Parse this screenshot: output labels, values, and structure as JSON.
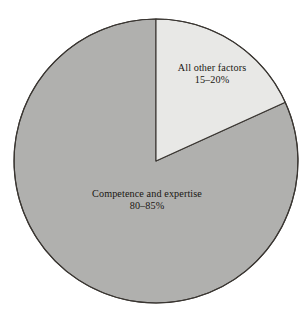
{
  "chart_data": {
    "type": "pie",
    "title": "",
    "subtitle": "",
    "xlabel": "",
    "ylabel": "",
    "grid": false,
    "legend_position": "none",
    "labels_placement": "inside-slices",
    "total_degrees": 360,
    "start_angle_deg": 0,
    "direction": "clockwise",
    "categories": [
      "All other factors",
      "Competence and expertise"
    ],
    "values": [
      18,
      82
    ],
    "value_labels": [
      "15–20%",
      "80–85%"
    ],
    "slices": [
      {
        "name": "All other factors",
        "label": "All other factors",
        "value_label": "15–20%",
        "range_low": 15,
        "range_high": 20,
        "value": 18,
        "sweep_deg": 65.6,
        "start_deg": 0,
        "end_deg": 65.6,
        "color": "#e8e8e6"
      },
      {
        "name": "Competence and expertise",
        "label": "Competence and expertise",
        "value_label": "80–85%",
        "range_low": 80,
        "range_high": 85,
        "value": 82,
        "sweep_deg": 294.4,
        "start_deg": 65.6,
        "end_deg": 360,
        "color": "#b0b0ae"
      }
    ]
  },
  "figure": {
    "background_color": "#ffffff",
    "outline_color": "#3a3632",
    "text_color": "#1a1713",
    "center_x": 156,
    "center_y": 161,
    "radius": 142
  },
  "labels": {
    "other_factors": {
      "title": "All other factors",
      "value": "15–20%"
    },
    "competence": {
      "title": "Competence and expertise",
      "value": "80–85%"
    }
  }
}
